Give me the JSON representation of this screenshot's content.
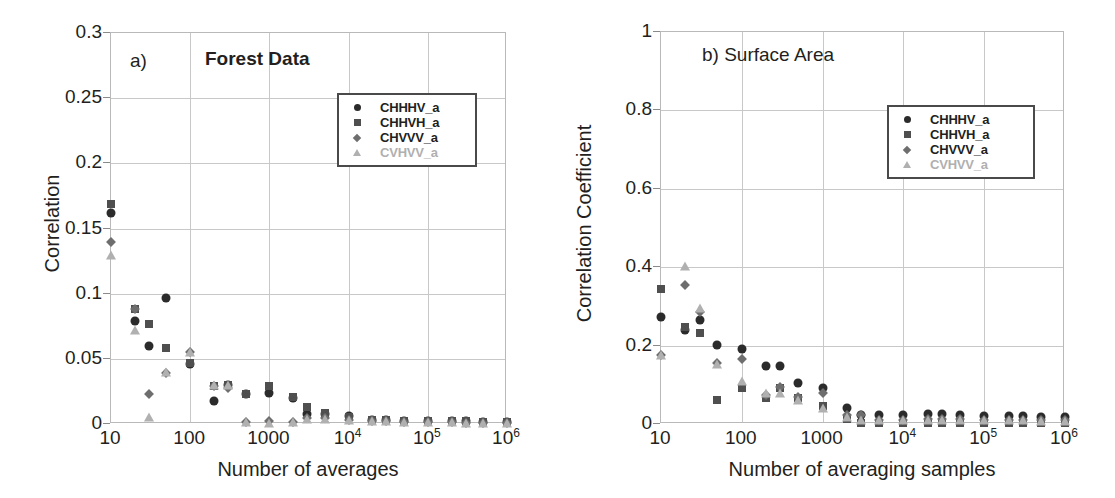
{
  "figure": {
    "background": "#ffffff",
    "series_colors": {
      "CHHHV_a": "#2b2b2b",
      "CHHVH_a": "#4f4f4f",
      "CHVVV_a": "#6e6e6e",
      "CVHVV_a": "#b0b0b0"
    },
    "marker_shapes": {
      "CHHHV_a": "circle",
      "CHHVH_a": "square",
      "CHVVV_a": "diamond",
      "CVHVV_a": "triangle"
    }
  },
  "panel_a": {
    "tag": "a)",
    "title": "Forest Data",
    "legend_title_color": "#231f20"
  },
  "panel_b": {
    "tag": "b) Surface Area"
  },
  "legend": {
    "entries": [
      {
        "label": "CHHHV_a",
        "shape": "circle",
        "color": "#2b2b2b"
      },
      {
        "label": "CHHVH_a",
        "shape": "square",
        "color": "#4f4f4f"
      },
      {
        "label": "CHVVV_a",
        "shape": "diamond",
        "color": "#6e6e6e"
      },
      {
        "label": "CVHVV_a",
        "shape": "triangle",
        "color": "#b0b0b0"
      }
    ]
  },
  "chart_data": [
    {
      "id": "panel-a",
      "type": "scatter",
      "title": "Forest Data",
      "panel_tag": "a)",
      "xlabel": "Number of averages",
      "ylabel": "Correlation",
      "xscale": "log",
      "xlim": [
        10,
        1000000
      ],
      "ylim": [
        0,
        0.3
      ],
      "grid": true,
      "legend_position": "upper-right",
      "xticks": [
        {
          "value": 10,
          "label": "10"
        },
        {
          "value": 100,
          "label": "100"
        },
        {
          "value": 1000,
          "label": "1000"
        },
        {
          "value": 10000,
          "label": "10",
          "exp": "4"
        },
        {
          "value": 100000,
          "label": "10",
          "exp": "5"
        },
        {
          "value": 1000000,
          "label": "10",
          "exp": "6"
        }
      ],
      "yticks": [
        {
          "value": 0,
          "label": "0"
        },
        {
          "value": 0.05,
          "label": "0.05"
        },
        {
          "value": 0.1,
          "label": "0.1"
        },
        {
          "value": 0.15,
          "label": "0.15"
        },
        {
          "value": 0.2,
          "label": "0.2"
        },
        {
          "value": 0.25,
          "label": "0.25"
        },
        {
          "value": 0.3,
          "label": "0.3"
        }
      ],
      "x": [
        10,
        20,
        30,
        50,
        100,
        200,
        300,
        500,
        1000,
        2000,
        3000,
        5000,
        10000,
        20000,
        30000,
        50000,
        100000,
        200000,
        300000,
        500000,
        1000000
      ],
      "series": [
        {
          "name": "CHHHV_a",
          "shape": "circle",
          "color": "#2b2b2b",
          "values": [
            0.162,
            0.079,
            0.06,
            0.097,
            0.046,
            0.018,
            0.03,
            0.023,
            0.024,
            0.02,
            0.0075,
            0.0075,
            0.006,
            0.003,
            0.003,
            0.002,
            0.002,
            0.002,
            0.002,
            0.0015,
            0.0015
          ]
        },
        {
          "name": "CHHVH_a",
          "shape": "square",
          "color": "#4f4f4f",
          "values": [
            0.169,
            0.088,
            0.077,
            0.058,
            0.047,
            0.029,
            0.03,
            0.023,
            0.029,
            0.021,
            0.013,
            0.0085,
            0.0055,
            0.003,
            0.003,
            0.002,
            0.002,
            0.002,
            0.002,
            0.0015,
            0.0015
          ]
        },
        {
          "name": "CHVVV_a",
          "shape": "diamond",
          "color": "#6e6e6e",
          "values": [
            0.14,
            0.088,
            0.023,
            0.039,
            0.055,
            0.029,
            0.028,
            0.0015,
            0.0025,
            0.0015,
            0.0045,
            0.0045,
            0.003,
            0.002,
            0.002,
            0.0015,
            0.0015,
            0.0015,
            0.001,
            0.001,
            0.001
          ]
        },
        {
          "name": "CVHVV_a",
          "shape": "triangle",
          "color": "#b0b0b0",
          "values": [
            0.13,
            0.072,
            0.005,
            0.04,
            0.055,
            0.03,
            0.03,
            0.0015,
            0.001,
            0.0015,
            0.004,
            0.004,
            0.003,
            0.002,
            0.002,
            0.0015,
            0.0015,
            0.0015,
            0.001,
            0.001,
            0.001
          ]
        }
      ]
    },
    {
      "id": "panel-b",
      "type": "scatter",
      "title": "Surface Area",
      "panel_tag": "b) Surface Area",
      "xlabel": "Number of averaging samples",
      "ylabel": "Correlation Coefficient",
      "xscale": "log",
      "xlim": [
        10,
        1000000
      ],
      "ylim": [
        0,
        1
      ],
      "grid": true,
      "legend_position": "upper-right",
      "xticks": [
        {
          "value": 10,
          "label": "10"
        },
        {
          "value": 100,
          "label": "100"
        },
        {
          "value": 1000,
          "label": "1000"
        },
        {
          "value": 10000,
          "label": "10",
          "exp": "4"
        },
        {
          "value": 100000,
          "label": "10",
          "exp": "5"
        },
        {
          "value": 1000000,
          "label": "10",
          "exp": "6"
        }
      ],
      "yticks": [
        {
          "value": 0,
          "label": "0"
        },
        {
          "value": 0.2,
          "label": "0.2"
        },
        {
          "value": 0.4,
          "label": "0.4"
        },
        {
          "value": 0.6,
          "label": "0.6"
        },
        {
          "value": 0.8,
          "label": "0.8"
        },
        {
          "value": 1,
          "label": "1"
        }
      ],
      "x": [
        10,
        20,
        30,
        50,
        100,
        200,
        300,
        500,
        1000,
        2000,
        3000,
        5000,
        10000,
        20000,
        30000,
        50000,
        100000,
        200000,
        300000,
        500000,
        1000000
      ],
      "series": [
        {
          "name": "CHHHV_a",
          "shape": "circle",
          "color": "#2b2b2b",
          "values": [
            0.272,
            0.24,
            0.265,
            0.202,
            0.192,
            0.149,
            0.149,
            0.105,
            0.093,
            0.04,
            0.024,
            0.022,
            0.022,
            0.025,
            0.025,
            0.024,
            0.021,
            0.02,
            0.02,
            0.018,
            0.018
          ]
        },
        {
          "name": "CHHVH_a",
          "shape": "square",
          "color": "#4f4f4f",
          "values": [
            0.345,
            0.247,
            0.232,
            0.06,
            0.092,
            0.067,
            0.092,
            0.066,
            0.046,
            0.012,
            0.002,
            0.002,
            0.002,
            0.003,
            0.003,
            0.003,
            0.003,
            0.003,
            0.003,
            0.002,
            0.002
          ]
        },
        {
          "name": "CHVVV_a",
          "shape": "diamond",
          "color": "#6e6e6e",
          "values": [
            0.175,
            0.355,
            0.285,
            0.155,
            0.165,
            0.073,
            0.095,
            0.068,
            0.08,
            0.024,
            0.022,
            0.01,
            0.01,
            0.012,
            0.012,
            0.012,
            0.01,
            0.01,
            0.01,
            0.009,
            0.009
          ]
        },
        {
          "name": "CVHVV_a",
          "shape": "triangle",
          "color": "#b0b0b0",
          "values": [
            0.175,
            0.402,
            0.295,
            0.152,
            0.11,
            0.08,
            0.078,
            0.062,
            0.042,
            0.018,
            0.01,
            0.009,
            0.009,
            0.01,
            0.01,
            0.01,
            0.009,
            0.009,
            0.009,
            0.008,
            0.008
          ]
        }
      ]
    }
  ]
}
